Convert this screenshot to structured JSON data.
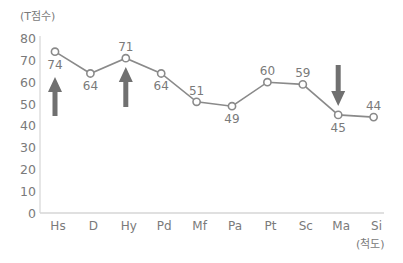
{
  "chart_data": {
    "type": "line",
    "title": "",
    "xlabel": "(척도)",
    "ylabel": "(T점수)",
    "ylim": [
      0,
      80
    ],
    "yticks": [
      0,
      10,
      20,
      30,
      40,
      50,
      60,
      70,
      80
    ],
    "grid": false,
    "categories": [
      "Hs",
      "D",
      "Hy",
      "Pd",
      "Mf",
      "Pa",
      "Pt",
      "Sc",
      "Ma",
      "Si"
    ],
    "series": [
      {
        "name": "T점수",
        "values": [
          74,
          64,
          71,
          64,
          51,
          49,
          60,
          59,
          45,
          44
        ]
      }
    ],
    "annotations": [
      {
        "type": "arrow-up",
        "category": "Hs"
      },
      {
        "type": "arrow-up",
        "category": "Hy"
      },
      {
        "type": "arrow-down",
        "category": "Ma"
      }
    ],
    "colors": {
      "line": "#8a8a8a",
      "text": "#7a7a7a",
      "arrow": "#707070",
      "axis": "#cfcfcf"
    }
  }
}
